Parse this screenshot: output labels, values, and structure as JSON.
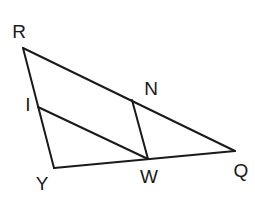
{
  "diagram": {
    "type": "geometry-triangle",
    "points": {
      "R": {
        "x": 23,
        "y": 48
      },
      "N": {
        "x": 132,
        "y": 100
      },
      "Q": {
        "x": 235,
        "y": 151
      },
      "W": {
        "x": 148,
        "y": 159
      },
      "I": {
        "x": 38,
        "y": 107
      },
      "Y": {
        "x": 54,
        "y": 168
      }
    },
    "segments": [
      {
        "id": "RQ",
        "from": "R",
        "to": "Q"
      },
      {
        "id": "RY",
        "from": "R",
        "to": "Y"
      },
      {
        "id": "YQ",
        "from": "Y",
        "to": "Q"
      },
      {
        "id": "IW",
        "from": "I",
        "to": "W"
      },
      {
        "id": "NW",
        "from": "N",
        "to": "W"
      }
    ],
    "labels": [
      {
        "id": "R",
        "text": "R",
        "x": 19,
        "y": 33
      },
      {
        "id": "N",
        "text": "N",
        "x": 151,
        "y": 90
      },
      {
        "id": "I",
        "text": "I",
        "x": 28,
        "y": 106
      },
      {
        "id": "Y",
        "text": "Y",
        "x": 42,
        "y": 185
      },
      {
        "id": "W",
        "text": "W",
        "x": 149,
        "y": 178
      },
      {
        "id": "Q",
        "text": "Q",
        "x": 241,
        "y": 172
      }
    ],
    "line_color": "#1a1a1a",
    "background": "#ffffff"
  }
}
